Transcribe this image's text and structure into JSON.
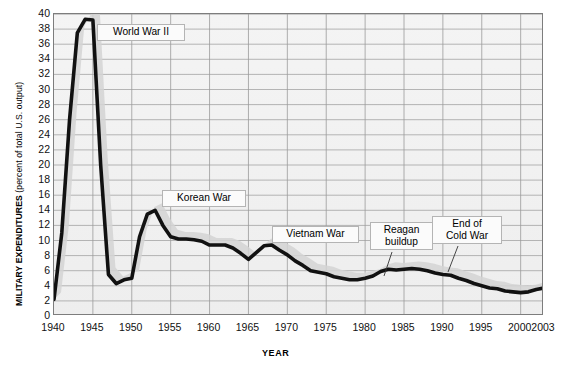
{
  "chart_data": {
    "type": "line",
    "title": "",
    "xlabel": "YEAR",
    "ylabel": "MILITARY EXPENDITURES (percent of total U.S. output)",
    "ylabel_main": "MILITARY EXPENDITURES",
    "ylabel_sub": "(percent of total U.S. output)",
    "xlim": [
      1940,
      2003
    ],
    "ylim": [
      0,
      40
    ],
    "grid": true,
    "legend": "none",
    "ytick_labels": [
      "0",
      "2",
      "4",
      "6",
      "8",
      "10",
      "12",
      "14",
      "16",
      "18",
      "20",
      "22",
      "24",
      "26",
      "28",
      "30",
      "32",
      "34",
      "36",
      "38",
      "40"
    ],
    "ytick_values": [
      0,
      2,
      4,
      6,
      8,
      10,
      12,
      14,
      16,
      18,
      20,
      22,
      24,
      26,
      28,
      30,
      32,
      34,
      36,
      38,
      40
    ],
    "xtick_labels": [
      "1940",
      "1945",
      "1950",
      "1955",
      "1960",
      "1965",
      "1970",
      "1975",
      "1980",
      "1985",
      "1990",
      "1995",
      "2000",
      "2003"
    ],
    "xtick_values": [
      1940,
      1945,
      1950,
      1955,
      1960,
      1965,
      1970,
      1975,
      1980,
      1985,
      1990,
      1995,
      2000,
      2003
    ],
    "series": [
      {
        "name": "Military expenditures as percent of U.S. output",
        "color": "#111111",
        "x": [
          1940,
          1941,
          1942,
          1943,
          1944,
          1945,
          1946,
          1947,
          1948,
          1949,
          1950,
          1951,
          1952,
          1953,
          1954,
          1955,
          1956,
          1957,
          1958,
          1959,
          1960,
          1961,
          1962,
          1963,
          1964,
          1965,
          1966,
          1967,
          1968,
          1969,
          1970,
          1971,
          1972,
          1973,
          1974,
          1975,
          1976,
          1977,
          1978,
          1979,
          1980,
          1981,
          1982,
          1983,
          1984,
          1985,
          1986,
          1987,
          1988,
          1989,
          1990,
          1991,
          1992,
          1993,
          1994,
          1995,
          1996,
          1997,
          1998,
          1999,
          2000,
          2001,
          2002,
          2003
        ],
        "y": [
          2.2,
          11.0,
          26.0,
          37.5,
          39.3,
          39.2,
          20.0,
          5.5,
          4.3,
          4.8,
          5.0,
          10.5,
          13.5,
          14.0,
          12.0,
          10.5,
          10.2,
          10.2,
          10.1,
          9.9,
          9.4,
          9.4,
          9.4,
          9.0,
          8.3,
          7.5,
          8.4,
          9.3,
          9.4,
          8.7,
          8.1,
          7.3,
          6.7,
          6.0,
          5.8,
          5.6,
          5.2,
          5.0,
          4.8,
          4.8,
          5.0,
          5.3,
          5.9,
          6.2,
          6.1,
          6.2,
          6.3,
          6.2,
          6.0,
          5.7,
          5.5,
          5.4,
          5.0,
          4.7,
          4.3,
          4.0,
          3.7,
          3.6,
          3.3,
          3.2,
          3.1,
          3.2,
          3.5,
          3.7
        ],
        "linewidth": 3.6,
        "shadow": true
      }
    ],
    "annotations": [
      {
        "name": "world-war-ii",
        "text": "World War II",
        "lines": [
          "World War II"
        ],
        "x": 97,
        "y": 24,
        "w": 78,
        "h": 16
      },
      {
        "name": "korean-war",
        "text": "Korean War",
        "lines": [
          "Korean War"
        ],
        "x": 162,
        "y": 190,
        "w": 74,
        "h": 16
      },
      {
        "name": "vietnam-war",
        "text": "Vietnam War",
        "lines": [
          "Vietnam War"
        ],
        "x": 272,
        "y": 226,
        "w": 77,
        "h": 16
      },
      {
        "name": "reagan-buildup",
        "text": "Reagan buildup",
        "lines": [
          "Reagan",
          "buildup"
        ],
        "x": 370,
        "y": 222,
        "w": 53,
        "h": 29
      },
      {
        "name": "end-of-cold-war",
        "text": "End of Cold War",
        "lines": [
          "End of",
          "Cold War"
        ],
        "x": 432,
        "y": 216,
        "w": 60,
        "h": 29
      }
    ]
  }
}
